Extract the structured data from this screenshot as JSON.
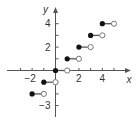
{
  "chart_data": {
    "type": "scatter",
    "title": "",
    "subtitle": "Step function y = floor(x)",
    "xlabel": "x",
    "ylabel": "y",
    "xlim": [
      -3.5,
      6.5
    ],
    "ylim": [
      -4,
      5.5
    ],
    "grid": false,
    "legend": null,
    "x_ticks": [
      -3,
      -2,
      -1,
      0,
      1,
      2,
      3,
      4,
      5
    ],
    "x_tick_labels": [
      {
        "value": -2,
        "label": "−2"
      },
      {
        "value": 2,
        "label": "2"
      },
      {
        "value": 4,
        "label": "4"
      }
    ],
    "y_ticks": [
      -3,
      -2,
      -1,
      1,
      2,
      3,
      4
    ],
    "y_tick_labels": [
      {
        "value": 4,
        "label": "4"
      },
      {
        "value": 2,
        "label": "2"
      },
      {
        "value": -3,
        "label": "−3"
      }
    ],
    "segments": [
      {
        "y": -2,
        "x_start": -2,
        "x_end": -1,
        "start_closed": true,
        "end_closed": false
      },
      {
        "y": -1,
        "x_start": -1,
        "x_end": 0,
        "start_closed": true,
        "end_closed": false
      },
      {
        "y": 0,
        "x_start": 0,
        "x_end": 1,
        "start_closed": true,
        "end_closed": false
      },
      {
        "y": 1,
        "x_start": 1,
        "x_end": 2,
        "start_closed": true,
        "end_closed": false
      },
      {
        "y": 2,
        "x_start": 2,
        "x_end": 3,
        "start_closed": true,
        "end_closed": false
      },
      {
        "y": 3,
        "x_start": 3,
        "x_end": 4,
        "start_closed": true,
        "end_closed": false
      },
      {
        "y": 4,
        "x_start": 4,
        "x_end": 5,
        "start_closed": true,
        "end_closed": false
      }
    ],
    "colors": {
      "axis": "#555555",
      "line": "#555555",
      "closed_dot": "#111111",
      "open_dot_fill": "#ffffff",
      "open_dot_stroke": "#777777"
    }
  }
}
